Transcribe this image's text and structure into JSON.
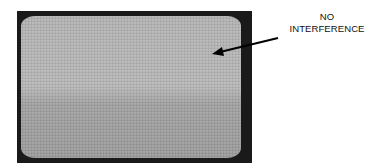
{
  "figure": {
    "annotation": {
      "line1": "NO",
      "line2": "INTERFERENCE"
    },
    "screen": {
      "description": "TV screen showing uniform static/snow noise",
      "colors": {
        "frame": "#1a1a1a",
        "screen_upper": "#b6b6b6",
        "screen_lower": "#9e9e9e"
      }
    }
  }
}
